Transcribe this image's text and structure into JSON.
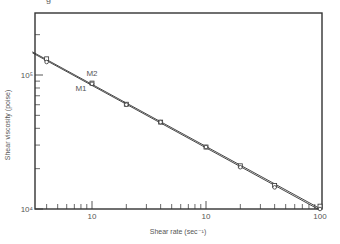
{
  "chart_data": {
    "type": "line",
    "title": "",
    "xlabel": "Shear rate (sec⁻¹)",
    "ylabel": "Shear viscosity (poise)",
    "xscale": "log",
    "yscale": "log",
    "xlim": [
      0.3,
      100
    ],
    "ylim": [
      10000,
      290000
    ],
    "x_tick_labels": [
      {
        "value": 1,
        "label": "10"
      },
      {
        "value": 10,
        "label": "10"
      },
      {
        "value": 100,
        "label": "100"
      }
    ],
    "y_tick_labels": [
      {
        "value": 10000,
        "label": "10⁴"
      },
      {
        "value": 100000,
        "label": "10⁵"
      }
    ],
    "x_minor_ticks": [
      0.4,
      0.5,
      0.6,
      0.7,
      0.8,
      0.9,
      2,
      3,
      4,
      5,
      6,
      7,
      8,
      9,
      20,
      30,
      40,
      50,
      60,
      70,
      80,
      90
    ],
    "y_minor_ticks": [
      20000,
      30000,
      40000,
      50000,
      60000,
      70000,
      80000,
      90000,
      200000
    ],
    "grid": false,
    "legend": "inline labels",
    "x": [
      0.4,
      1.0,
      2,
      4,
      10,
      20,
      40,
      100
    ],
    "series": [
      {
        "name": "M2",
        "marker": "square",
        "values": [
          132000,
          87000,
          60500,
          44500,
          29000,
          21000,
          15000,
          10500
        ]
      },
      {
        "name": "M1",
        "marker": "circle",
        "values": [
          125000,
          86000,
          60000,
          44500,
          29000,
          20500,
          14500,
          10000
        ]
      }
    ],
    "annotations": [
      {
        "text": "M2",
        "x": 1.0,
        "y": 98000
      },
      {
        "text": "M1",
        "x": 0.8,
        "y": 76000
      }
    ]
  },
  "labels": {
    "xlabel": "Shear rate (sec⁻¹)",
    "ylabel": "Shear viscosity (poise)",
    "fragment": "g"
  }
}
